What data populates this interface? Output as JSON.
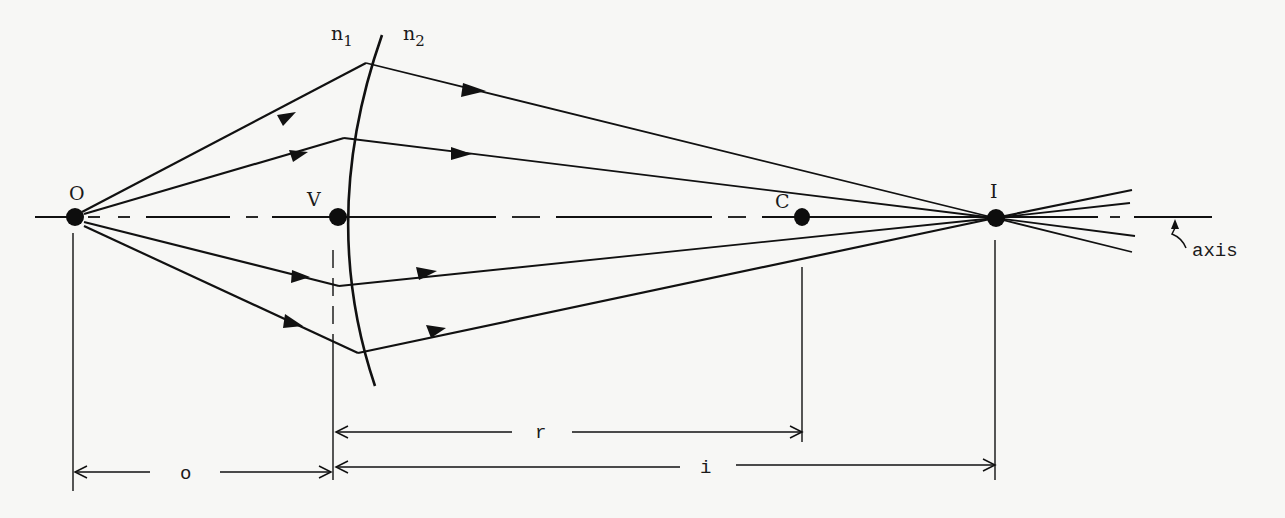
{
  "diagram": {
    "media": {
      "n1": "n",
      "n1_sub": "1",
      "n2": "n",
      "n2_sub": "2"
    },
    "points": {
      "object": "O",
      "vertex": "V",
      "center": "C",
      "image": "I"
    },
    "axis_label": "axis",
    "dimensions": {
      "object_distance": "o",
      "image_distance": "i",
      "radius": "r"
    },
    "colors": {
      "ink": "#111111",
      "paper": "#f7f7f5"
    }
  }
}
